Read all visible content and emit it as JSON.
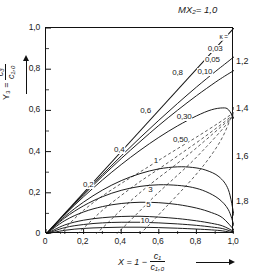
{
  "figure": {
    "top_label": "MX₂= 1,0",
    "x_axis": {
      "title_prefix": "X = 1 −",
      "title_num": "c₁",
      "title_den": "c₁,₀",
      "ticks": [
        "0",
        "0,2",
        "0,4",
        "0,6",
        "0,8",
        "1,0"
      ],
      "values": [
        0,
        0.2,
        0.4,
        0.6,
        0.8,
        1.0
      ],
      "min": 0,
      "max": 1.0
    },
    "y_axis": {
      "title_prefix": "Y₃ =",
      "title_num": "c₃",
      "title_den": "c₁,₀",
      "ticks": [
        "0",
        "0,2",
        "0,4",
        "0,6",
        "0,8",
        "1,0"
      ],
      "values": [
        0,
        0.2,
        0.4,
        0.6,
        0.8,
        1.0
      ],
      "min": 0,
      "max": 1.0
    },
    "right_labels": [
      {
        "text": "1,2",
        "y": 0.835
      },
      {
        "text": "1,4",
        "y": 0.605
      },
      {
        "text": "1,6",
        "y": 0.375
      },
      {
        "text": "1,8",
        "y": 0.155
      }
    ],
    "kappa_legend": "κ ="
  },
  "chart_data": {
    "type": "line",
    "title": "",
    "xlabel": "X = 1 - c1/c1,0",
    "ylabel": "Y3 = c3/c1,0",
    "xlim": [
      0,
      1.0
    ],
    "ylim": [
      0,
      1.0
    ],
    "grid": false,
    "legend": "inline curve labels",
    "series": [
      {
        "name": "0,03",
        "style": "solid",
        "label": "0,03",
        "label_pos": [
          0.9,
          0.9
        ],
        "points": [
          [
            0,
            0
          ],
          [
            0.1,
            0.098
          ],
          [
            0.2,
            0.194
          ],
          [
            0.3,
            0.288
          ],
          [
            0.4,
            0.379
          ],
          [
            0.5,
            0.467
          ],
          [
            0.6,
            0.552
          ],
          [
            0.7,
            0.634
          ],
          [
            0.8,
            0.713
          ],
          [
            0.9,
            0.788
          ],
          [
            0.95,
            0.824
          ],
          [
            1.0,
            0.86
          ]
        ]
      },
      {
        "name": "0,05",
        "style": "solid",
        "label": "0,05",
        "label_pos": [
          0.885,
          0.845
        ],
        "points": [
          [
            0,
            0
          ],
          [
            0.1,
            0.097
          ],
          [
            0.2,
            0.19
          ],
          [
            0.3,
            0.28
          ],
          [
            0.4,
            0.366
          ],
          [
            0.5,
            0.448
          ],
          [
            0.6,
            0.527
          ],
          [
            0.7,
            0.601
          ],
          [
            0.8,
            0.671
          ],
          [
            0.9,
            0.736
          ],
          [
            0.95,
            0.766
          ],
          [
            1.0,
            0.794
          ]
        ]
      },
      {
        "name": "0,10",
        "style": "solid",
        "label": "0,10",
        "label_pos": [
          0.845,
          0.785
        ],
        "points": [
          [
            0,
            0
          ],
          [
            0.1,
            0.094
          ],
          [
            0.2,
            0.181
          ],
          [
            0.3,
            0.262
          ],
          [
            0.4,
            0.337
          ],
          [
            0.5,
            0.406
          ],
          [
            0.6,
            0.469
          ],
          [
            0.7,
            0.525
          ],
          [
            0.8,
            0.573
          ],
          [
            0.88,
            0.603
          ],
          [
            0.94,
            0.612
          ],
          [
            0.97,
            0.604
          ],
          [
            1.0,
            0.56
          ]
        ]
      },
      {
        "name": "0,30",
        "style": "solid",
        "label": "0,30",
        "label_pos": [
          0.735,
          0.57
        ],
        "points": [
          [
            0,
            0
          ],
          [
            0.1,
            0.085
          ],
          [
            0.2,
            0.155
          ],
          [
            0.3,
            0.213
          ],
          [
            0.4,
            0.259
          ],
          [
            0.5,
            0.293
          ],
          [
            0.6,
            0.316
          ],
          [
            0.7,
            0.326
          ],
          [
            0.78,
            0.323
          ],
          [
            0.85,
            0.31
          ],
          [
            0.92,
            0.278
          ],
          [
            0.97,
            0.215
          ],
          [
            1.0,
            0.09
          ]
        ]
      },
      {
        "name": "0,50",
        "style": "solid",
        "label": "0,50",
        "label_pos": [
          0.715,
          0.455
        ],
        "points": [
          [
            0,
            0
          ],
          [
            0.1,
            0.078
          ],
          [
            0.2,
            0.137
          ],
          [
            0.3,
            0.181
          ],
          [
            0.4,
            0.212
          ],
          [
            0.5,
            0.231
          ],
          [
            0.6,
            0.239
          ],
          [
            0.7,
            0.236
          ],
          [
            0.78,
            0.226
          ],
          [
            0.85,
            0.206
          ],
          [
            0.92,
            0.17
          ],
          [
            0.97,
            0.118
          ],
          [
            1.0,
            0.04
          ]
        ]
      },
      {
        "name": "1",
        "style": "solid",
        "label": "1",
        "label_pos": [
          0.585,
          0.355
        ],
        "points": [
          [
            0,
            0
          ],
          [
            0.1,
            0.065
          ],
          [
            0.2,
            0.107
          ],
          [
            0.3,
            0.133
          ],
          [
            0.4,
            0.148
          ],
          [
            0.5,
            0.154
          ],
          [
            0.6,
            0.152
          ],
          [
            0.7,
            0.143
          ],
          [
            0.8,
            0.126
          ],
          [
            0.88,
            0.104
          ],
          [
            0.94,
            0.078
          ],
          [
            1.0,
            0.02
          ]
        ]
      },
      {
        "name": "3",
        "style": "solid",
        "label": "3",
        "label_pos": [
          0.555,
          0.215
        ],
        "points": [
          [
            0,
            0
          ],
          [
            0.1,
            0.044
          ],
          [
            0.2,
            0.067
          ],
          [
            0.3,
            0.079
          ],
          [
            0.4,
            0.085
          ],
          [
            0.5,
            0.086
          ],
          [
            0.6,
            0.082
          ],
          [
            0.7,
            0.075
          ],
          [
            0.8,
            0.064
          ],
          [
            0.88,
            0.052
          ],
          [
            0.94,
            0.039
          ],
          [
            1.0,
            0.012
          ]
        ]
      },
      {
        "name": "5",
        "style": "solid",
        "label": "5",
        "label_pos": [
          0.545,
          0.14
        ],
        "points": [
          [
            0,
            0
          ],
          [
            0.1,
            0.031
          ],
          [
            0.2,
            0.046
          ],
          [
            0.3,
            0.054
          ],
          [
            0.4,
            0.057
          ],
          [
            0.5,
            0.057
          ],
          [
            0.6,
            0.054
          ],
          [
            0.7,
            0.049
          ],
          [
            0.8,
            0.042
          ],
          [
            0.88,
            0.034
          ],
          [
            0.94,
            0.026
          ],
          [
            1.0,
            0.008
          ]
        ]
      },
      {
        "name": "10",
        "style": "solid",
        "label": "10",
        "label_pos": [
          0.525,
          0.065
        ],
        "points": [
          [
            0,
            0
          ],
          [
            0.1,
            0.018
          ],
          [
            0.2,
            0.027
          ],
          [
            0.3,
            0.031
          ],
          [
            0.4,
            0.033
          ],
          [
            0.5,
            0.033
          ],
          [
            0.6,
            0.031
          ],
          [
            0.7,
            0.028
          ],
          [
            0.8,
            0.024
          ],
          [
            0.88,
            0.02
          ],
          [
            0.94,
            0.015
          ],
          [
            1.0,
            0.005
          ]
        ]
      }
    ],
    "contours": [
      {
        "name": "MX2 = 0,2",
        "style": "dashed",
        "label": "0,2",
        "label_pos": [
          0.225,
          0.24
        ],
        "points": [
          [
            0.075,
            0.0
          ],
          [
            0.13,
            0.055
          ],
          [
            0.2,
            0.115
          ],
          [
            0.29,
            0.178
          ],
          [
            0.4,
            0.245
          ],
          [
            0.53,
            0.318
          ],
          [
            0.66,
            0.392
          ],
          [
            0.8,
            0.47
          ],
          [
            0.92,
            0.54
          ],
          [
            1.0,
            0.59
          ]
        ]
      },
      {
        "name": "MX2 = 0,4",
        "style": "dashed",
        "label": "0,4",
        "label_pos": [
          0.39,
          0.41
        ],
        "points": [
          [
            0.165,
            0.0
          ],
          [
            0.23,
            0.055
          ],
          [
            0.3,
            0.115
          ],
          [
            0.39,
            0.18
          ],
          [
            0.49,
            0.248
          ],
          [
            0.61,
            0.322
          ],
          [
            0.73,
            0.398
          ],
          [
            0.85,
            0.476
          ],
          [
            0.95,
            0.545
          ],
          [
            1.0,
            0.585
          ]
        ]
      },
      {
        "name": "MX2 = 0,6",
        "style": "dashed",
        "label": "0,6",
        "label_pos": [
          0.53,
          0.595
        ],
        "points": [
          [
            0.265,
            0.0
          ],
          [
            0.33,
            0.055
          ],
          [
            0.4,
            0.118
          ],
          [
            0.48,
            0.185
          ],
          [
            0.575,
            0.256
          ],
          [
            0.685,
            0.333
          ],
          [
            0.79,
            0.41
          ],
          [
            0.89,
            0.488
          ],
          [
            0.97,
            0.552
          ],
          [
            1.0,
            0.58
          ]
        ]
      },
      {
        "name": "MX2 = 0,8",
        "style": "dashed",
        "label": "0,8",
        "label_pos": [
          0.7,
          0.78
        ],
        "points": [
          [
            0.375,
            0.0
          ],
          [
            0.44,
            0.058
          ],
          [
            0.51,
            0.122
          ],
          [
            0.585,
            0.19
          ],
          [
            0.675,
            0.265
          ],
          [
            0.77,
            0.345
          ],
          [
            0.855,
            0.425
          ],
          [
            0.93,
            0.5
          ],
          [
            0.98,
            0.555
          ],
          [
            1.0,
            0.58
          ]
        ]
      },
      {
        "name": "MX2 = 1,0",
        "style": "dashed-edge",
        "label": "1,0",
        "label_pos": [
          1.0,
          1.0
        ],
        "points": [
          [
            0.5,
            0.0
          ],
          [
            0.565,
            0.06
          ],
          [
            0.635,
            0.128
          ],
          [
            0.71,
            0.2
          ],
          [
            0.79,
            0.28
          ],
          [
            0.865,
            0.365
          ],
          [
            0.93,
            0.455
          ],
          [
            0.975,
            0.545
          ],
          [
            1.0,
            0.62
          ]
        ]
      }
    ],
    "envelope": {
      "name": "diagonal envelope Y3 = X",
      "style": "solid",
      "points": [
        [
          0,
          0
        ],
        [
          1.0,
          1.0
        ]
      ]
    }
  }
}
